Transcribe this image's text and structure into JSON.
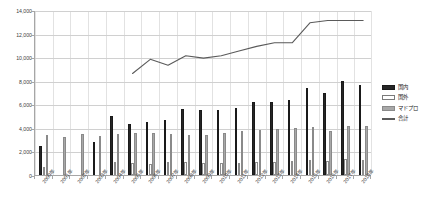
{
  "chart_data": {
    "type": "bar",
    "title": "",
    "subtitle": "",
    "xlabel": "",
    "ylabel": "",
    "ylim": [
      0,
      14000
    ],
    "ytick_step": 2000,
    "ytick_labels": [
      "0",
      "2,000",
      "4,000",
      "6,000",
      "8,000",
      "10,000",
      "12,000",
      "14,000"
    ],
    "ytick_values": [
      0,
      2000,
      4000,
      6000,
      8000,
      10000,
      12000,
      14000
    ],
    "grid": true,
    "legend_position": "right",
    "categories": [
      "2000年",
      "2001年",
      "2002年",
      "2003年",
      "2004年",
      "2005年",
      "2006年",
      "2007年",
      "2008年",
      "2009年",
      "2010年",
      "2011年",
      "2012年",
      "2013年",
      "2014年",
      "2015年",
      "2016年",
      "2017年",
      "2018年"
    ],
    "series": [
      {
        "name": "国内",
        "type": "bar",
        "fill": "#262626",
        "values": [
          2500,
          0,
          0,
          2800,
          5000,
          4300,
          4500,
          4700,
          5600,
          5500,
          5500,
          5700,
          6200,
          6200,
          6400,
          7400,
          7000,
          8000,
          7600
        ]
      },
      {
        "name": "国外",
        "type": "bar",
        "fill": "#ffffff",
        "values": [
          700,
          0,
          0,
          0,
          1100,
          1000,
          900,
          1100,
          1100,
          1000,
          1000,
          1000,
          1100,
          1100,
          1200,
          1300,
          1200,
          1400,
          1300
        ]
      },
      {
        "name": "マドプロ",
        "type": "bar",
        "fill": "#a8a8a8",
        "values": [
          3400,
          3200,
          3500,
          3300,
          3500,
          3600,
          3600,
          3500,
          3400,
          3400,
          3600,
          3700,
          3800,
          3900,
          4000,
          4100,
          3700,
          4200,
          4200
        ]
      },
      {
        "name": "合計",
        "type": "line",
        "stroke": "#5a5a5a",
        "values": [
          null,
          null,
          null,
          null,
          null,
          8700,
          9900,
          9400,
          10200,
          10000,
          10200,
          10600,
          11000,
          11300,
          11300,
          13000,
          13200,
          13200,
          13200
        ]
      }
    ],
    "legend": [
      "国内",
      "国外",
      "マドプロ",
      "合計"
    ]
  },
  "colors": {
    "kokunai": "#262626",
    "kokugai": "#ffffff",
    "madopro": "#a8a8a8",
    "goukei": "#5a5a5a",
    "grid": "#d0d0d0",
    "axis": "#a6a6a6",
    "background": "#ffffff"
  }
}
